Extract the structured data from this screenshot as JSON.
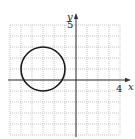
{
  "chart_data": {
    "type": "line",
    "title": "",
    "xlabel": "x",
    "ylabel": "y",
    "xlim": [
      -6,
      4
    ],
    "ylim": [
      -5,
      5
    ],
    "grid": true,
    "grid_style": "dotted",
    "tick_labels": {
      "x": [
        {
          "value": 4,
          "label": "4"
        }
      ],
      "y": [
        {
          "value": 5,
          "label": "5"
        }
      ]
    },
    "series": [
      {
        "name": "circle",
        "shape": "circle",
        "center": [
          -3,
          1
        ],
        "radius": 2,
        "equation": "(x + 3)^2 + (y - 1)^2 = 4"
      }
    ],
    "colors": {
      "curve": "#1a1a1a",
      "axis": "#333333",
      "grid": "#9a9a9a"
    }
  },
  "labels": {
    "x_axis": "x",
    "y_axis": "y",
    "x_tick": "4",
    "y_tick": "5"
  }
}
